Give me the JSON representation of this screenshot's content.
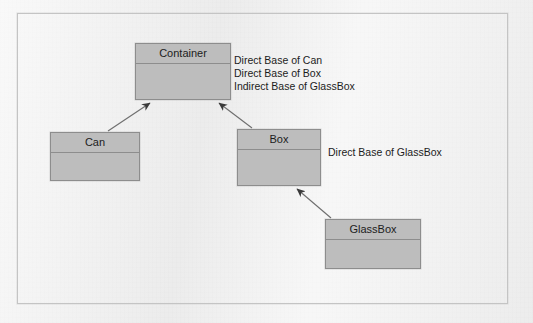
{
  "diagram": {
    "type": "uml-class-inheritance",
    "background_color": "#eeeeee",
    "frame_border_color": "#c4c4c4",
    "box_fill_color": "#bdbdbd",
    "box_border_color": "#8d8d8d",
    "text_color": "#1c1c1c",
    "arrow_color": "#3a3a3a"
  },
  "classes": [
    {
      "id": "container",
      "name": "Container",
      "x": 135,
      "y": 43,
      "width": 96,
      "height": 57
    },
    {
      "id": "can",
      "name": "Can",
      "x": 50,
      "y": 132,
      "width": 90,
      "height": 49
    },
    {
      "id": "box",
      "name": "Box",
      "x": 237,
      "y": 129,
      "width": 84,
      "height": 57
    },
    {
      "id": "glassbox",
      "name": "GlassBox",
      "x": 325,
      "y": 219,
      "width": 96,
      "height": 50
    }
  ],
  "annotations": [
    {
      "id": "container-roles",
      "x": 234,
      "y": 54,
      "lines": [
        "Direct Base of Can",
        "Direct Base of Box",
        "Indirect Base of GlassBox"
      ]
    },
    {
      "id": "box-roles",
      "x": 328,
      "y": 146,
      "lines": [
        "Direct Base of GlassBox"
      ]
    }
  ],
  "relationships": [
    {
      "id": "can-to-container",
      "from": "Can",
      "to": "Container",
      "kind": "inheritance"
    },
    {
      "id": "box-to-container",
      "from": "Box",
      "to": "Container",
      "kind": "inheritance"
    },
    {
      "id": "glassbox-to-box",
      "from": "GlassBox",
      "to": "Box",
      "kind": "inheritance"
    }
  ]
}
